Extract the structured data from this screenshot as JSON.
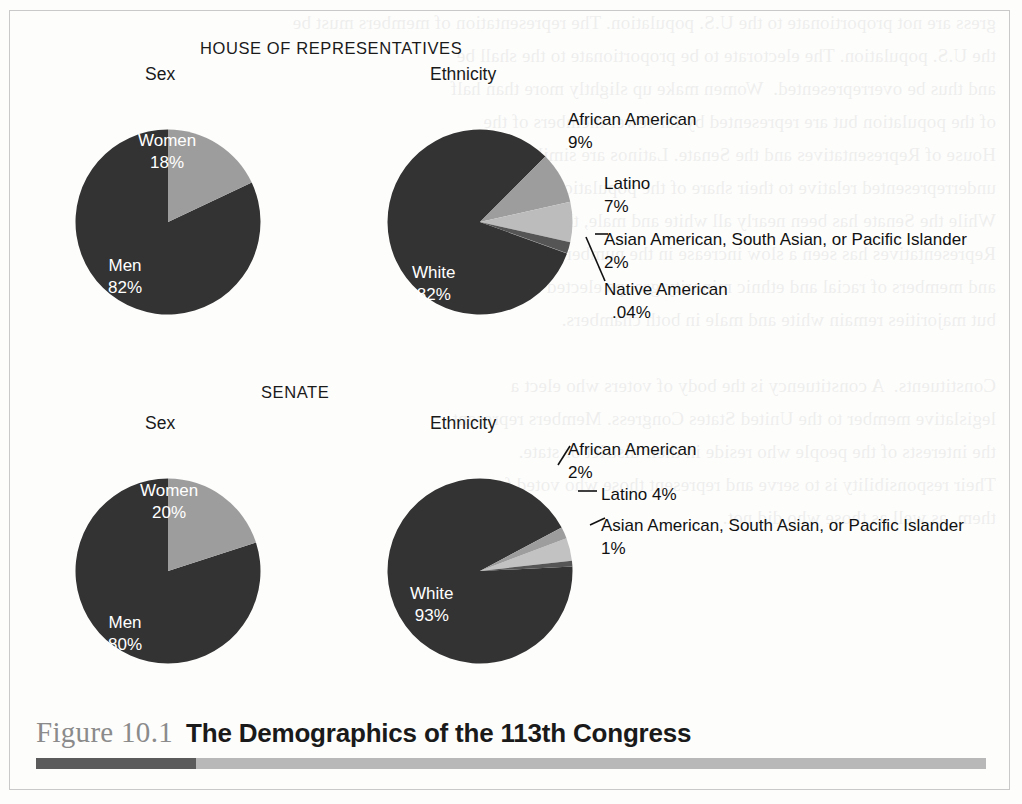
{
  "figure": {
    "number": "Figure 10.1",
    "title": "The Demographics of the 113th Congress",
    "ghost_text": "gress are not proportionate to the U.S. population. The representation of members must be\nthe U.S. population. The electorate to be proportionate to the shall be\nand thus be overrepresented.  Women make up slightly more than half\nof the population but are represented by far fewer members of the\nHouse of Representatives and the Senate. Latinos are similarly\nunderrepresented relative to their share of the population overall.\nWhile the Senate has been nearly all white and male, the House of\nRepresentatives has seen a slow increase in the number of women\nand members of racial and ethnic minority groups elected to seats,\nbut majorities remain white and male in both chambers.\n\nConstituents.  A constituency is the body of voters who elect a\nlegislative member to the United States Congress. Members represent\nthe interests of the people who reside in their district or state.\nTheir responsibility is to serve and represent those who voted for\nthem, as well as those who did not."
  },
  "sections": [
    {
      "id": "house",
      "heading": "HOUSE OF REPRESENTATIVES",
      "charts": [
        {
          "id": "house-sex",
          "title": "Sex",
          "chart_data": {
            "type": "pie",
            "title": "Sex",
            "labels": [
              "Women",
              "Men"
            ],
            "values": [
              18,
              82
            ],
            "value_labels": [
              "18%",
              "82%"
            ],
            "colors": [
              "#9d9d9d",
              "#333333"
            ],
            "start_angle_deg": 0,
            "direction": "clockwise",
            "legend": "inside-slices"
          }
        },
        {
          "id": "house-ethnicity",
          "title": "Ethnicity",
          "chart_data": {
            "type": "pie",
            "title": "Ethnicity",
            "labels": [
              "African American",
              "Latino",
              "Asian American, South Asian, or Pacific Islander",
              "Native American",
              "White"
            ],
            "values": [
              9,
              7,
              2,
              0.04,
              82
            ],
            "value_labels": [
              "9%",
              "7%",
              "2%",
              ".04%",
              "82%"
            ],
            "colors": [
              "#9d9d9d",
              "#bcbcbc",
              "#555555",
              "#777777",
              "#333333"
            ],
            "start_angle_deg": 45,
            "direction": "clockwise",
            "legend": "callouts"
          }
        }
      ]
    },
    {
      "id": "senate",
      "heading": "SENATE",
      "charts": [
        {
          "id": "senate-sex",
          "title": "Sex",
          "chart_data": {
            "type": "pie",
            "title": "Sex",
            "labels": [
              "Women",
              "Men"
            ],
            "values": [
              20,
              80
            ],
            "value_labels": [
              "20%",
              "80%"
            ],
            "colors": [
              "#9d9d9d",
              "#333333"
            ],
            "start_angle_deg": 0,
            "direction": "clockwise",
            "legend": "inside-slices"
          }
        },
        {
          "id": "senate-ethnicity",
          "title": "Ethnicity",
          "chart_data": {
            "type": "pie",
            "title": "Ethnicity",
            "labels": [
              "African American",
              "Latino",
              "Asian American, South Asian, or Pacific Islander",
              "White"
            ],
            "values": [
              2,
              4,
              1,
              93
            ],
            "value_labels": [
              "2%",
              "4%",
              "1%",
              "93%"
            ],
            "colors": [
              "#9d9d9d",
              "#c2c2c2",
              "#555555",
              "#333333"
            ],
            "start_angle_deg": 62,
            "direction": "clockwise",
            "legend": "callouts"
          }
        }
      ]
    }
  ],
  "labels": {
    "house_sex_women": "Women",
    "house_sex_women_pct": "18%",
    "house_sex_men": "Men",
    "house_sex_men_pct": "82%",
    "house_eth_white": "White",
    "house_eth_white_pct": "82%",
    "house_eth_aa": "African American",
    "house_eth_aa_pct": "9%",
    "house_eth_latino": "Latino",
    "house_eth_latino_pct": "7%",
    "house_eth_asian": "Asian American, South Asian, or Pacific Islander",
    "house_eth_asian_pct": "2%",
    "house_eth_native": "Native American",
    "house_eth_native_pct": ".04%",
    "senate_sex_women": "Women",
    "senate_sex_women_pct": "20%",
    "senate_sex_men": "Men",
    "senate_sex_men_pct": "80%",
    "senate_eth_white": "White",
    "senate_eth_white_pct": "93%",
    "senate_eth_aa": "African American",
    "senate_eth_aa_pct": "2%",
    "senate_eth_latino": "Latino 4%",
    "senate_eth_asian": "Asian American, South Asian, or Pacific Islander",
    "senate_eth_asian_pct": "1%"
  },
  "colors": {
    "dark_slice": "#333333",
    "mid_slice": "#9d9d9d",
    "light_slice": "#bcbcbc",
    "caption_number": "#8b8b8b",
    "rule_dark": "#5b5b5b",
    "rule_light": "#b8b8b8",
    "frame_border": "#c9c9c9"
  }
}
